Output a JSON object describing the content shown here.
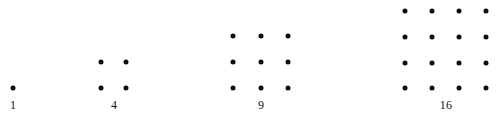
{
  "figure": {
    "width": 496,
    "height": 118,
    "background_color": "#ffffff",
    "dot_color": "#0d0d0d",
    "dot_diameter_px": 5,
    "label_color": "#141414",
    "label_font_size_px": 12,
    "label_baseline_y": 111
  },
  "chart_data": {
    "type": "scatter",
    "xlabel": "",
    "ylabel": "",
    "categories": [
      "1",
      "4",
      "9",
      "16"
    ],
    "values": [
      1,
      4,
      9,
      16
    ],
    "series": [
      {
        "name": "1",
        "side": 1,
        "dot_count": 1,
        "label": "1",
        "label_x": 13,
        "label_y": 111,
        "x_positions": [
          13
        ],
        "y_positions": [
          88
        ]
      },
      {
        "name": "4",
        "side": 2,
        "dot_count": 4,
        "label": "4",
        "label_x": 114,
        "label_y": 111,
        "x_positions": [
          101,
          126
        ],
        "y_positions": [
          62,
          88
        ]
      },
      {
        "name": "9",
        "side": 3,
        "dot_count": 9,
        "label": "9",
        "label_x": 261,
        "label_y": 111,
        "x_positions": [
          233,
          261,
          288
        ],
        "y_positions": [
          36,
          62,
          88
        ]
      },
      {
        "name": "16",
        "side": 4,
        "dot_count": 16,
        "label": "16",
        "label_x": 446,
        "label_y": 111,
        "x_positions": [
          405,
          432,
          459,
          486
        ],
        "y_positions": [
          11,
          37,
          63,
          88
        ]
      }
    ]
  }
}
